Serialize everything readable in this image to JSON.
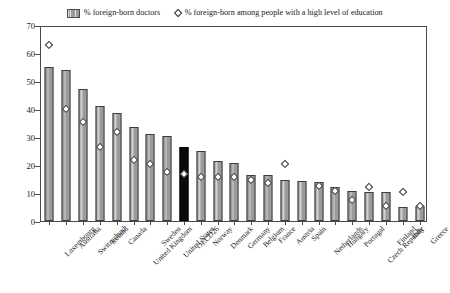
{
  "chart_data": {
    "type": "bar",
    "title": "",
    "xlabel": "",
    "ylabel": "",
    "ylim": [
      0,
      70
    ],
    "yticks": [
      0,
      10,
      20,
      30,
      40,
      50,
      60,
      70
    ],
    "grid": false,
    "legend_position": "top",
    "categories": [
      "Luxembourg",
      "Australia",
      "Switzerland",
      "Ireland",
      "Canada",
      "United Kingdom",
      "Sweden",
      "United States",
      "OECD26",
      "Norway",
      "Denmark",
      "Germany",
      "Belgium",
      "France",
      "Austria",
      "Spain",
      "Netherlands",
      "Hungary",
      "Portugal",
      "Czech Republic",
      "Finland",
      "Italy",
      "Greece"
    ],
    "series": [
      {
        "name": "% foreign-born doctors",
        "marker": "bar",
        "values": [
          55,
          54,
          47,
          41,
          38.5,
          33.5,
          31,
          30.5,
          26.5,
          25,
          21.5,
          20.7,
          16.3,
          16.3,
          14.7,
          14.2,
          14.1,
          12,
          10.6,
          10.3,
          10.2,
          5,
          5.5
        ],
        "highlight_category": "OECD26",
        "highlight_color": "#000000",
        "bar_color": "#9b9b9b"
      },
      {
        "name": "% foreign-born among people with a high level of education",
        "marker": "diamond",
        "values": [
          63,
          40,
          35.5,
          26.5,
          32,
          22,
          20.5,
          17.5,
          17,
          15.8,
          15.8,
          15.8,
          14.7,
          13.6,
          20.5,
          null,
          12.5,
          10.8,
          7.6,
          12.2,
          5.4,
          10.5,
          5.5
        ],
        "marker_face_color": "#ffffff",
        "marker_edge_color": "#2a2a2a"
      }
    ]
  },
  "legend": {
    "entries": [
      {
        "label": "% foreign-born doctors",
        "icon": "bar-swatch"
      },
      {
        "label": "% foreign-born among people with a high level of education",
        "icon": "diamond-marker"
      }
    ]
  }
}
